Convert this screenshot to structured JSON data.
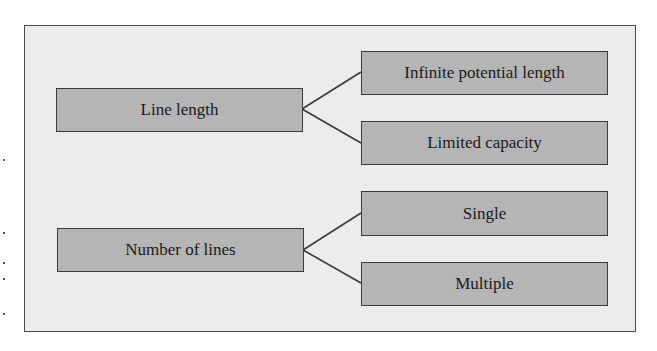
{
  "diagram": {
    "type": "tree",
    "colors": {
      "frame_background": "#ececec",
      "frame_border": "#4a4a4a",
      "node_fill": "#b5b5b5",
      "node_border": "#3a3a3a",
      "connector": "#3a3a3a",
      "text": "#1a1a1a"
    },
    "groups": [
      {
        "root": "Line length",
        "children": [
          "Infinite potential length",
          "Limited capacity"
        ]
      },
      {
        "root": "Number of lines",
        "children": [
          "Single",
          "Multiple"
        ]
      }
    ]
  }
}
